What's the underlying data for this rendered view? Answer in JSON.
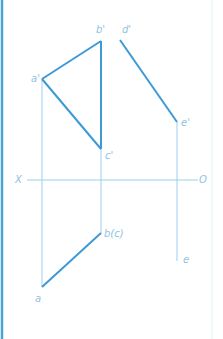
{
  "diagram": {
    "title": "",
    "colors": {
      "border": "#4aa3d6",
      "thick_line": "#3d9ad6",
      "thin_line": "#9dcdec",
      "label": "#8fc3e4"
    },
    "axis": {
      "left_label": "X",
      "right_label": "O",
      "y": 180,
      "x1": 27,
      "x2": 198
    },
    "points": {
      "a_prime": {
        "label": "a'",
        "x": 42,
        "y": 79
      },
      "b_prime": {
        "label": "b'",
        "x": 101,
        "y": 41
      },
      "c_prime": {
        "label": "c'",
        "x": 101,
        "y": 149
      },
      "d_prime": {
        "label": "d'",
        "x": 120,
        "y": 40
      },
      "e_prime": {
        "label": "e'",
        "x": 177,
        "y": 122
      },
      "a": {
        "label": "a",
        "x": 42,
        "y": 287
      },
      "b_c": {
        "label": "b(c)",
        "x": 101,
        "y": 233
      },
      "e": {
        "label": "e",
        "x": 177,
        "y": 261
      }
    }
  }
}
